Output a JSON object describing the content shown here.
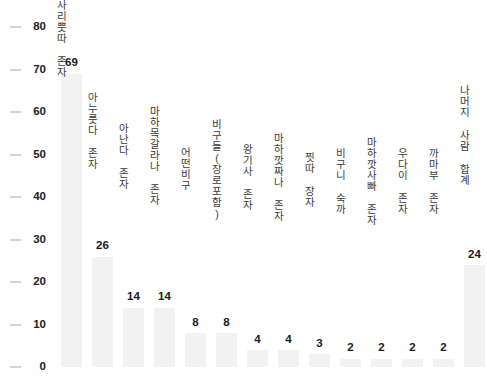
{
  "chart_data": {
    "type": "bar",
    "title": "",
    "subtitle": "",
    "xlabel": "",
    "ylabel": "",
    "ylim": [
      0,
      80
    ],
    "yticks": [
      0,
      10,
      20,
      30,
      40,
      50,
      60,
      70,
      80
    ],
    "grid": false,
    "legend": false,
    "orientation": "vertical",
    "bar_color": "#f2f2f2",
    "text_color": "#1a1a1a",
    "tick_color": "#d4d4d4",
    "background": "#ffffff",
    "categories": [
      "사리뿟따 존자",
      "아누룻다 존자",
      "아난다 존자",
      "마하목갈라나 존자",
      "어떤비구",
      "비구들(장로포함)",
      "왕기사 존자",
      "마하깟짜나 존자",
      "찟따 장자",
      "비구니 숙까",
      "마하깟사빠 존자",
      "우다이 존자",
      "까마부 존자",
      "나머지 사람 합계"
    ],
    "values": [
      69,
      26,
      14,
      14,
      8,
      8,
      4,
      4,
      3,
      2,
      2,
      2,
      2,
      24
    ],
    "value_labels": [
      "69",
      "26",
      "14",
      "14",
      "8",
      "8",
      "4",
      "4",
      "3",
      "2",
      "2",
      "2",
      "2",
      "24"
    ],
    "ytick_labels": [
      "0",
      "10",
      "20",
      "30",
      "40",
      "50",
      "60",
      "70",
      "80"
    ]
  }
}
